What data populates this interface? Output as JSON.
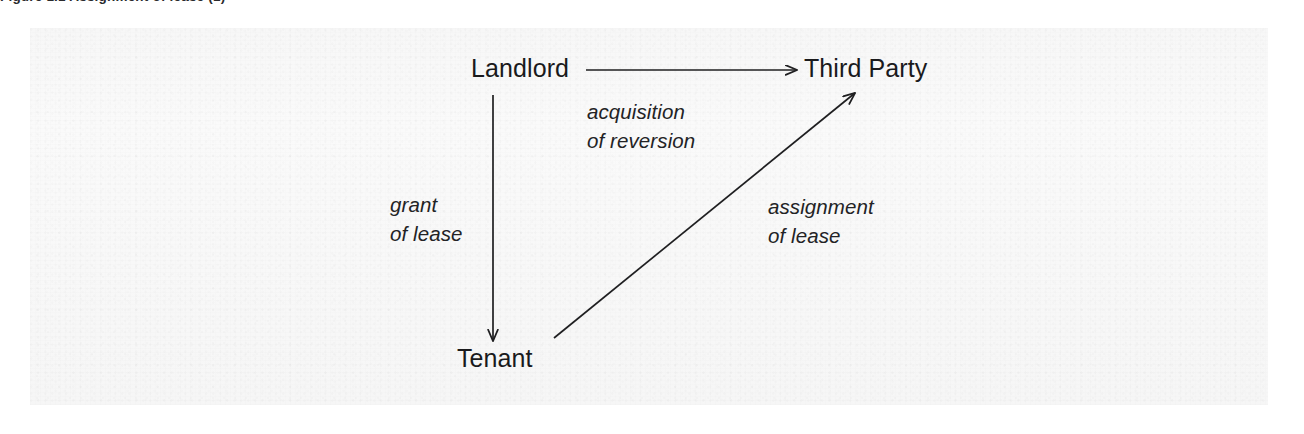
{
  "figure": {
    "caption_sliver": "Figure 1.1  Assignment of lease (1)",
    "panel_color": "#f8f8f8",
    "ink_color": "#1a1a1c"
  },
  "diagram": {
    "type": "relationship-diagram",
    "nodes": [
      {
        "id": "landlord",
        "label": "Landlord",
        "x": 520,
        "y": 70
      },
      {
        "id": "third-party",
        "label": "Third Party",
        "x": 862,
        "y": 70
      },
      {
        "id": "tenant",
        "label": "Tenant",
        "x": 500,
        "y": 358
      }
    ],
    "edges": [
      {
        "id": "landlord-to-third-party",
        "from": "landlord",
        "to": "third-party",
        "direction": "right",
        "label_line1": "acquisition",
        "label_line2": "of reversion"
      },
      {
        "id": "landlord-to-tenant",
        "from": "landlord",
        "to": "tenant",
        "direction": "down",
        "label_line1": "grant",
        "label_line2": "of lease"
      },
      {
        "id": "tenant-to-third-party",
        "from": "tenant",
        "to": "third-party",
        "direction": "diagonal-up-right",
        "label_line1": "assignment",
        "label_line2": "of lease"
      }
    ]
  }
}
